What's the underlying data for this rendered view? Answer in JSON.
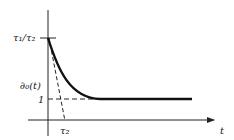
{
  "diagram": {
    "y_tick_top_label": "τ₁/τ₂",
    "y_tick_one_label": "1",
    "curve_label": "∂₀(t)",
    "x_tick_label": "τ₂",
    "x_axis_label": "t",
    "colors": {
      "ink": "#222222",
      "background": "#ffffff"
    }
  }
}
